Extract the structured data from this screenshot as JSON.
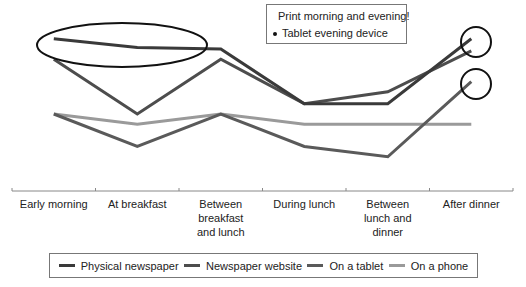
{
  "chart_data": {
    "type": "line",
    "title": "",
    "xlabel": "",
    "ylabel": "",
    "ylim": [
      0,
      100
    ],
    "grid": false,
    "legend_position": "bottom",
    "categories": [
      "Early morning",
      "At breakfast",
      "Between breakfast and lunch",
      "During lunch",
      "Between lunch and dinner",
      "After dinner"
    ],
    "series": [
      {
        "name": "Physical newspaper",
        "color": "#3a3a3a",
        "values": [
          89,
          84,
          83,
          51,
          51,
          89
        ]
      },
      {
        "name": "Newspaper website",
        "color": "#4d4d4d",
        "values": [
          77,
          45,
          77,
          51,
          58,
          82
        ]
      },
      {
        "name": "On a tablet",
        "color": "#5a5a5a",
        "values": [
          45,
          26,
          45,
          26,
          20,
          64
        ]
      },
      {
        "name": "On a phone",
        "color": "#9a9a9a",
        "values": [
          45,
          39,
          45,
          39,
          39,
          39
        ]
      }
    ],
    "annotations": [
      {
        "type": "text_box",
        "items": [
          "Print morning and evening!",
          "Tablet evening device"
        ]
      },
      {
        "type": "ellipse",
        "target": "Physical newspaper, Early morning to Between breakfast and lunch"
      },
      {
        "type": "circle",
        "target": "Physical newspaper & Newspaper website, After dinner"
      },
      {
        "type": "circle",
        "target": "On a tablet, After dinner"
      }
    ]
  },
  "x_labels": [
    [
      "Early morning"
    ],
    [
      "At breakfast"
    ],
    [
      "Between",
      "breakfast",
      "and lunch"
    ],
    [
      "During lunch"
    ],
    [
      "Between",
      "lunch and",
      "dinner"
    ],
    [
      "After dinner"
    ]
  ],
  "annotation": {
    "line1": "Print morning and evening!",
    "line2": "Tablet evening device"
  },
  "legend": {
    "items": [
      {
        "label": "Physical newspaper",
        "color": "#3a3a3a"
      },
      {
        "label": "Newspaper website",
        "color": "#4d4d4d"
      },
      {
        "label": "On a tablet",
        "color": "#5a5a5a"
      },
      {
        "label": "On a phone",
        "color": "#9a9a9a"
      }
    ]
  }
}
